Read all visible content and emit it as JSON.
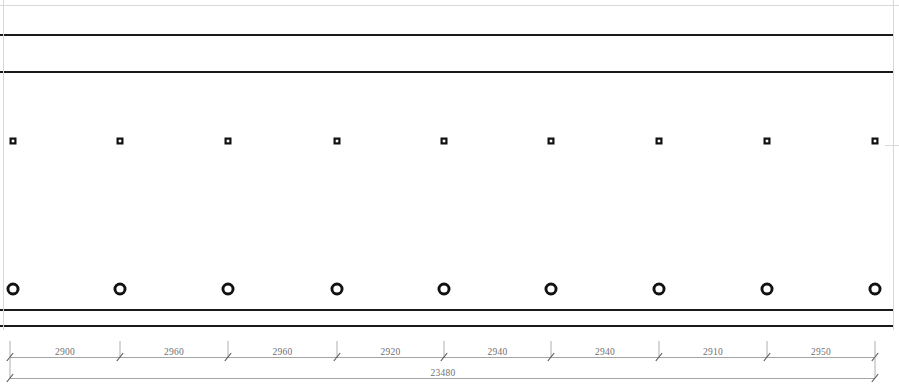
{
  "drawing": {
    "type": "elevation",
    "title": "Beam Elevation with Bolt and Hole Layout",
    "canvas": {
      "width": 899,
      "height": 390
    },
    "background_color": "#ffffff",
    "line_color_heavy": "#1a1a1a",
    "line_color_light": "#9a9a9a",
    "line_color_faint": "#d8d8d8",
    "marker_color": "#111111",
    "dim_text_color": "#6f6f6f"
  },
  "horizontal_lines": [
    {
      "name": "top-faint-edge",
      "y": 5,
      "x1": 0,
      "x2": 899,
      "weight": "faint"
    },
    {
      "name": "top-flange-line",
      "y": 35,
      "x1": 0,
      "x2": 893,
      "weight": "heavy"
    },
    {
      "name": "web-top-line",
      "y": 72,
      "x1": 0,
      "x2": 893,
      "weight": "heavy"
    },
    {
      "name": "web-bottom-line",
      "y": 310,
      "x1": 0,
      "x2": 893,
      "weight": "heavy"
    },
    {
      "name": "bottom-flange-line",
      "y": 326,
      "x1": 0,
      "x2": 893,
      "weight": "heavy"
    }
  ],
  "vertical_lines": [
    {
      "name": "left-edge-line",
      "x": 3,
      "y1": 0,
      "y2": 330,
      "weight": "light"
    },
    {
      "name": "right-edge-line",
      "x": 893,
      "y1": 0,
      "y2": 330,
      "weight": "light"
    }
  ],
  "edge_ticks": [
    {
      "name": "right-mid-tick",
      "x1": 885,
      "x2": 899,
      "y": 145
    }
  ],
  "square_markers": {
    "label": "bolt-square",
    "row_y": 141,
    "size": 7,
    "inner_size": 2.6,
    "x_positions": [
      13,
      120,
      228,
      337,
      444,
      551,
      659,
      767,
      875
    ]
  },
  "circle_markers": {
    "label": "hole-circle",
    "row_y": 289,
    "outer_radius": 6.5,
    "inner_radius": 3.6,
    "x_positions": [
      13,
      120,
      228,
      337,
      444,
      551,
      659,
      767,
      875
    ]
  },
  "dimension_chain": {
    "name": "primary-dimension-chain",
    "line_y": 357,
    "extension_top_y": 341,
    "extension_bottom_y": 363,
    "tick_style": "slash",
    "label_y": 355,
    "stations": [
      10,
      120,
      228,
      337,
      444,
      551,
      659,
      767,
      875
    ],
    "segments": [
      {
        "label": "2900",
        "x1": 10,
        "x2": 120
      },
      {
        "label": "2960",
        "x1": 120,
        "x2": 228
      },
      {
        "label": "2960",
        "x1": 228,
        "x2": 337
      },
      {
        "label": "2920",
        "x1": 337,
        "x2": 444
      },
      {
        "label": "2940",
        "x1": 444,
        "x2": 551
      },
      {
        "label": "2940",
        "x1": 551,
        "x2": 659
      },
      {
        "label": "2910",
        "x1": 659,
        "x2": 767
      },
      {
        "label": "2950",
        "x1": 767,
        "x2": 875
      }
    ]
  },
  "overall_dimension": {
    "name": "overall-dimension",
    "label": "23480",
    "line_y": 378,
    "x1": 10,
    "x2": 875,
    "label_x": 443,
    "label_y": 376
  }
}
